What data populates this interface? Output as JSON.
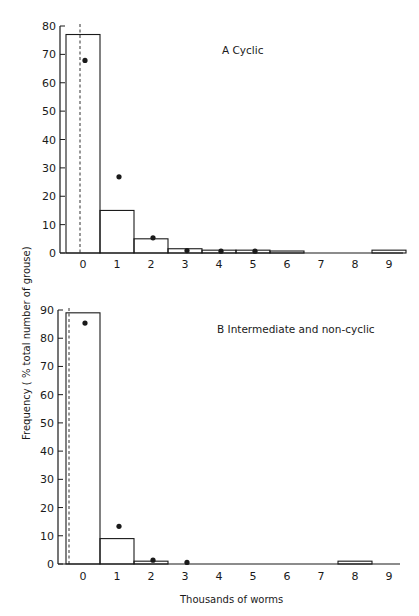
{
  "chart_data": [
    {
      "type": "bar",
      "panel": "A",
      "title": "A  Cyclic",
      "xlabel": "",
      "ylabel": "Frequency ( % total number of grouse)",
      "categories": [
        "0",
        "1",
        "2",
        "3",
        "4",
        "5",
        "6",
        "7",
        "8",
        "9"
      ],
      "ylim": [
        0,
        80
      ],
      "yticks": [
        0,
        10,
        20,
        30,
        40,
        50,
        60,
        70,
        80
      ],
      "series": [
        {
          "name": "Observed (bars)",
          "style": "open-bar",
          "values": [
            77,
            15,
            5,
            1.5,
            1,
            1,
            0.7,
            0,
            0,
            1
          ]
        },
        {
          "name": "Expected (dots)",
          "style": "dot",
          "values": [
            67.5,
            26.5,
            5,
            0.5,
            0.3,
            0.3,
            null,
            null,
            null,
            null
          ]
        }
      ],
      "reference_line": {
        "style": "dashed",
        "x": "0"
      },
      "grid": false
    },
    {
      "type": "bar",
      "panel": "B",
      "title": "B  Intermediate and non-cyclic",
      "xlabel": "Thousands of worms",
      "ylabel": "Frequency ( % total number of grouse)",
      "categories": [
        "0",
        "1",
        "2",
        "3",
        "4",
        "5",
        "6",
        "7",
        "8",
        "9"
      ],
      "ylim": [
        0,
        90
      ],
      "yticks": [
        0,
        10,
        20,
        30,
        40,
        50,
        60,
        70,
        80,
        90
      ],
      "series": [
        {
          "name": "Observed (bars)",
          "style": "open-bar",
          "values": [
            89,
            9,
            1,
            0,
            0,
            0,
            0,
            0,
            1,
            0
          ]
        },
        {
          "name": "Expected (dots)",
          "style": "dot",
          "values": [
            85,
            13,
            1,
            0.2,
            null,
            null,
            null,
            null,
            null,
            null
          ]
        }
      ],
      "reference_line": {
        "style": "dashed",
        "x": "0"
      },
      "grid": false
    }
  ],
  "labels": {
    "panel_a_title": "A  Cyclic",
    "panel_b_title": "B  Intermediate and non-cyclic",
    "y_axis_title": "Frequency ( % total number of grouse)",
    "x_axis_title": "Thousands of worms"
  },
  "colors": {
    "ink": "#1a1a1a",
    "background": "#ffffff"
  }
}
